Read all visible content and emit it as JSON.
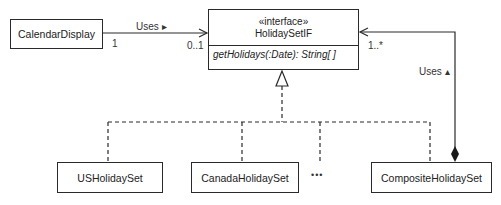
{
  "diagram": {
    "type": "UML class diagram",
    "classes": {
      "calendar_display": "CalendarDisplay",
      "interface": {
        "stereotype": "«interface»",
        "name": "HolidaySetIF",
        "operation": "getHolidays(:Date): String[ ]"
      },
      "us": "USHolidaySet",
      "canada": "CanadaHolidaySet",
      "ellipsis": "•••",
      "composite": "CompositeHolidaySet"
    },
    "associations": {
      "calendar_uses": {
        "label": "Uses ▸",
        "source_multiplicity": "1",
        "target_multiplicity": "0..1"
      },
      "composite_uses": {
        "label": "Uses ▴",
        "target_multiplicity": "1..*"
      }
    },
    "colors": {
      "line": "#2a2a2a",
      "background": "#ffffff"
    }
  }
}
